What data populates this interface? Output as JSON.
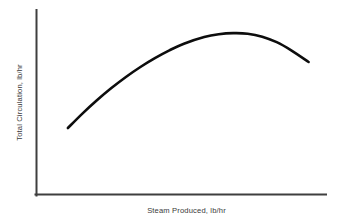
{
  "figure": {
    "background_color": "#ffffff",
    "axis_color": "#3f3f3f",
    "curve_color": "#0d0d0d",
    "label_color": "#3a3a3a"
  },
  "chart_data": {
    "type": "line",
    "title": "",
    "subtitle": "",
    "xlabel": "Steam Produced, lb/hr",
    "ylabel": "Total Circulation, lb/hr",
    "xlim": [
      0,
      100
    ],
    "ylim": [
      0,
      100
    ],
    "xticks": [],
    "yticks": [],
    "xticklabels": [],
    "yticklabels": [],
    "grid": false,
    "legend": null,
    "legend_position": "none",
    "annotations": [],
    "axes_style": "open-L (left and bottom spines only, no ticks, no tick labels)",
    "series": [
      {
        "name": "Total Circulation",
        "color": "#0d0d0d",
        "line_width": 2.6,
        "marker": "none",
        "x": [
          11.0,
          16.0,
          21.0,
          26.0,
          31.0,
          36.0,
          41.0,
          46.0,
          51.0,
          58.0,
          63.0,
          68.0,
          73.0,
          78.0,
          83.0,
          88.0,
          94.0
        ],
        "y": [
          36.2,
          44.0,
          51.2,
          57.8,
          63.8,
          69.2,
          74.0,
          78.2,
          81.8,
          85.4,
          86.9,
          87.5,
          87.2,
          85.6,
          82.6,
          78.2,
          71.9
        ],
        "peak": {
          "x": 68.0,
          "y": 87.5
        },
        "start_point": {
          "x": 11.0,
          "y": 36.2
        },
        "end_point": {
          "x": 94.0,
          "y": 71.9
        }
      }
    ]
  }
}
